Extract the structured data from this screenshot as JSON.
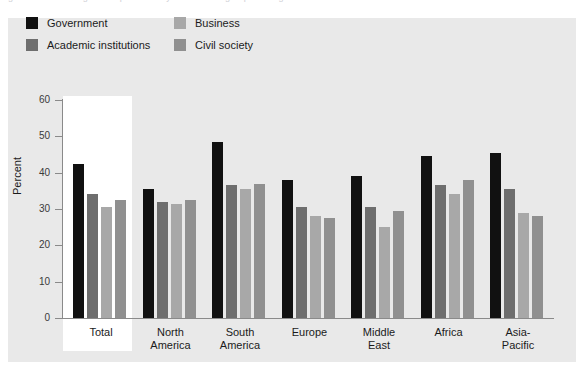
{
  "figure": {
    "title_sliver": "Figure 3.2  Percentage of respondents by stakeholder group and region",
    "y_axis_title": "Percent",
    "highlight_category": "Total"
  },
  "colors": {
    "panel_background": "#e9e9e9",
    "highlight_background": "#ffffff",
    "axis": "#8a8a8a",
    "text": "#1b1b1b",
    "government": "#111111",
    "academic_institutions": "#6e6e6e",
    "business": "#a8a8a8",
    "civil_society": "#909090"
  },
  "legend": {
    "items": [
      {
        "label": "Government",
        "color": "#111111"
      },
      {
        "label": "Academic institutions",
        "color": "#6e6e6e"
      },
      {
        "label": "Business",
        "color": "#a8a8a8"
      },
      {
        "label": "Civil society",
        "color": "#909090"
      }
    ]
  },
  "y_axis": {
    "ticks": [
      {
        "value": 0,
        "label": "0"
      },
      {
        "value": 10,
        "label": "10"
      },
      {
        "value": 20,
        "label": "20"
      },
      {
        "value": 30,
        "label": "30"
      },
      {
        "value": 40,
        "label": "40"
      },
      {
        "value": 50,
        "label": "50"
      },
      {
        "value": 60,
        "label": "60"
      }
    ]
  },
  "x_axis": {
    "categories": [
      {
        "line1": "Total",
        "line2": ""
      },
      {
        "line1": "North",
        "line2": "America"
      },
      {
        "line1": "South",
        "line2": "America"
      },
      {
        "line1": "Europe",
        "line2": ""
      },
      {
        "line1": "Middle",
        "line2": "East"
      },
      {
        "line1": "Africa",
        "line2": ""
      },
      {
        "line1": "Asia-",
        "line2": "Pacific"
      }
    ]
  },
  "chart_data": {
    "type": "bar",
    "title": "",
    "xlabel": "",
    "ylabel": "Percent",
    "ylim": [
      0,
      60
    ],
    "ytick_step": 10,
    "grid": false,
    "legend_position": "top-left",
    "categories": [
      "Total",
      "North America",
      "South America",
      "Europe",
      "Middle East",
      "Africa",
      "Asia-Pacific"
    ],
    "series": [
      {
        "name": "Government",
        "color": "#111111",
        "values": [
          42.5,
          35.5,
          48.5,
          38.0,
          39.0,
          44.5,
          45.5
        ]
      },
      {
        "name": "Academic institutions",
        "color": "#6e6e6e",
        "values": [
          34.0,
          32.0,
          36.5,
          30.5,
          30.5,
          36.5,
          35.5
        ]
      },
      {
        "name": "Business",
        "color": "#a8a8a8",
        "values": [
          30.5,
          31.5,
          35.5,
          28.0,
          25.0,
          34.0,
          29.0
        ]
      },
      {
        "name": "Civil society",
        "color": "#909090",
        "values": [
          32.5,
          32.5,
          37.0,
          27.5,
          29.5,
          38.0,
          28.0
        ]
      }
    ]
  }
}
